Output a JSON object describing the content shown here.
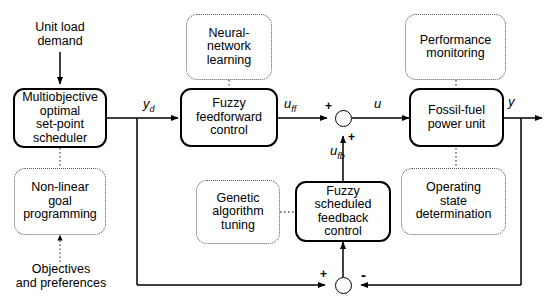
{
  "diagram": {
    "type": "block-diagram",
    "colors": {
      "line": "#000000",
      "dotted_line": "#555555",
      "background": "#ffffff"
    }
  },
  "blocks": {
    "scheduler": {
      "label": "Multiobjective\noptimal\nset-point\nscheduler",
      "style": "solid"
    },
    "feedforward": {
      "label": "Fuzzy\nfeedforward\ncontrol",
      "style": "solid"
    },
    "feedback": {
      "label": "Fuzzy\nscheduled\nfeedback\ncontrol",
      "style": "solid"
    },
    "plant": {
      "label": "Fossil-fuel\npower unit",
      "style": "solid"
    },
    "goal_programming": {
      "label": "Non-linear\ngoal\nprogramming",
      "style": "dotted"
    },
    "neural_network": {
      "label": "Neural-\nnetwork\nlearning",
      "style": "dotted"
    },
    "genetic": {
      "label": "Genetic\nalgorithm\ntuning",
      "style": "dotted"
    },
    "performance": {
      "label": "Performance\nmonitoring",
      "style": "dotted"
    },
    "operating_state": {
      "label": "Operating\nstate\ndetermination",
      "style": "dotted"
    }
  },
  "annotations": {
    "unit_load_demand": "Unit load\ndemand",
    "objectives": "Objectives\nand preferences"
  },
  "signals": {
    "yd": {
      "base": "y",
      "sub": "d"
    },
    "uff": {
      "base": "u",
      "sub": "ff"
    },
    "u": {
      "base": "u",
      "sub": ""
    },
    "ufb": {
      "base": "u",
      "sub": "fb"
    },
    "y": {
      "base": "y",
      "sub": ""
    }
  },
  "junctions": {
    "sum_control": {
      "inputs": [
        "+",
        "+"
      ]
    },
    "sum_error": {
      "inputs": [
        "+",
        "-"
      ]
    }
  },
  "signs": {
    "plus": "+",
    "minus": "-"
  }
}
